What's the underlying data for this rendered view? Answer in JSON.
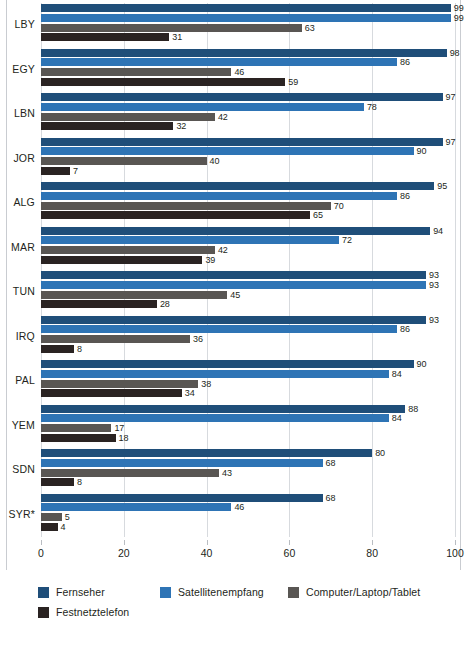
{
  "chart_data": {
    "type": "bar",
    "orientation": "horizontal",
    "title": "",
    "subtitle": "",
    "xlabel": "",
    "ylabel": "",
    "xlim": [
      0,
      100
    ],
    "xticks": [
      0,
      20,
      40,
      60,
      80,
      100
    ],
    "xtick_labels": [
      "0",
      "20",
      "40",
      "60",
      "80",
      "100"
    ],
    "grid": true,
    "grid_axis": "x",
    "legend_position": "bottom-left",
    "categories": [
      "LBY",
      "EGY",
      "LBN",
      "JOR",
      "ALG",
      "MAR",
      "TUN",
      "IRQ",
      "PAL",
      "YEM",
      "SDN",
      "SYR*"
    ],
    "series": [
      {
        "name": "Fernseher",
        "color": "#1f4e79",
        "values": [
          99,
          98,
          97,
          97,
          95,
          94,
          93,
          93,
          90,
          88,
          80,
          68
        ]
      },
      {
        "name": "Satellitenempfang",
        "color": "#2e74b5",
        "values": [
          99,
          86,
          78,
          90,
          86,
          72,
          93,
          86,
          84,
          84,
          68,
          46
        ]
      },
      {
        "name": "Computer/Laptop/Tablet",
        "color": "#595653",
        "values": [
          63,
          46,
          42,
          40,
          70,
          42,
          45,
          36,
          38,
          17,
          43,
          5
        ]
      },
      {
        "name": "Festnetztelefon",
        "color": "#2a2322",
        "values": [
          31,
          59,
          32,
          7,
          65,
          39,
          28,
          8,
          34,
          18,
          8,
          4
        ]
      }
    ]
  },
  "legend": {
    "items": [
      {
        "label": "Fernseher",
        "color": "#1f4e79"
      },
      {
        "label": "Satellitenempfang",
        "color": "#2e74b5"
      },
      {
        "label": "Computer/Laptop/Tablet",
        "color": "#595653"
      },
      {
        "label": "Festnetztelefon",
        "color": "#2a2322"
      }
    ]
  },
  "colors": {
    "gridline": "#d7dade",
    "frame": "#c9ccd1",
    "text": "#231f20",
    "background": "#ffffff"
  }
}
